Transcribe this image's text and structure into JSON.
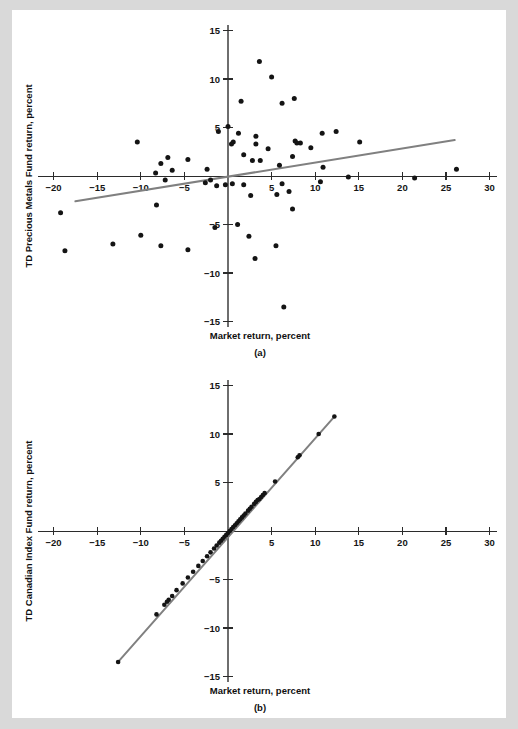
{
  "page": {
    "background_color": "#d9d9d9",
    "canvas_color": "#ffffff"
  },
  "style": {
    "point_color": "#141414",
    "fitline_color": "#808080",
    "axis_color": "#2b2b2b"
  },
  "figures": [
    {
      "id": "a",
      "panel_label": "(a)",
      "xlabel": "Market return, percent",
      "ylabel": "TD Precious Metals Fund return, percent",
      "xticks": [
        -20,
        -15,
        -10,
        -5,
        5,
        10,
        15,
        20,
        25,
        30
      ],
      "xtick_labels": [
        "−20",
        "−15",
        "−10",
        "−5",
        "5",
        "10",
        "15",
        "20",
        "25",
        "30"
      ],
      "yticks": [
        15,
        10,
        5,
        -5,
        -10,
        -15
      ],
      "ytick_labels": [
        "15",
        "10",
        "5",
        "−5",
        "−10",
        "−15"
      ]
    },
    {
      "id": "b",
      "panel_label": "(b)",
      "xlabel": "Market return, percent",
      "ylabel": "TD Canadian Index Fund return, percent",
      "xticks": [
        -20,
        -15,
        -10,
        -5,
        5,
        10,
        15,
        20,
        25,
        30
      ],
      "xtick_labels": [
        "−20",
        "−15",
        "−10",
        "−5",
        "5",
        "10",
        "15",
        "20",
        "25",
        "30"
      ],
      "yticks": [
        15,
        10,
        5,
        -5,
        -10,
        -15
      ],
      "ytick_labels": [
        "15",
        "10",
        "5",
        "−5",
        "−10",
        "−15"
      ]
    }
  ],
  "chart_data": [
    {
      "type": "scatter",
      "id": "a",
      "title": "(a)",
      "xlabel": "Market return, percent",
      "ylabel": "TD Precious Metals Fund return, percent",
      "xlim": [
        -22,
        31
      ],
      "ylim": [
        -16,
        16
      ],
      "grid": false,
      "legend": "none",
      "fit_line": {
        "x1": -17.5,
        "y1": -2.6,
        "x2": 26.0,
        "y2": 3.7
      },
      "points": [
        [
          3.6,
          11.8
        ],
        [
          5.0,
          10.2
        ],
        [
          1.5,
          7.7
        ],
        [
          6.2,
          7.5
        ],
        [
          7.6,
          8.0
        ],
        [
          0.0,
          5.1
        ],
        [
          -1.1,
          4.6
        ],
        [
          1.2,
          4.4
        ],
        [
          3.2,
          4.1
        ],
        [
          10.8,
          4.4
        ],
        [
          12.4,
          4.6
        ],
        [
          -10.4,
          3.5
        ],
        [
          0.6,
          3.5
        ],
        [
          0.4,
          3.3
        ],
        [
          3.2,
          3.3
        ],
        [
          7.7,
          3.6
        ],
        [
          7.9,
          3.4
        ],
        [
          8.3,
          3.4
        ],
        [
          15.1,
          3.5
        ],
        [
          9.5,
          2.9
        ],
        [
          4.6,
          2.8
        ],
        [
          1.8,
          2.2
        ],
        [
          -6.9,
          1.9
        ],
        [
          -4.6,
          1.7
        ],
        [
          2.8,
          1.6
        ],
        [
          3.7,
          1.6
        ],
        [
          7.4,
          2.0
        ],
        [
          -7.7,
          1.3
        ],
        [
          5.9,
          1.1
        ],
        [
          10.9,
          0.9
        ],
        [
          -6.4,
          0.6
        ],
        [
          -2.4,
          0.7
        ],
        [
          -8.3,
          0.3
        ],
        [
          -7.2,
          -0.4
        ],
        [
          -2.0,
          -0.4
        ],
        [
          -2.6,
          -0.7
        ],
        [
          -0.3,
          -0.9
        ],
        [
          0.5,
          -0.8
        ],
        [
          1.8,
          -0.9
        ],
        [
          -1.3,
          -1.0
        ],
        [
          6.2,
          -0.8
        ],
        [
          10.6,
          -0.6
        ],
        [
          13.8,
          -0.1
        ],
        [
          21.4,
          -0.2
        ],
        [
          26.2,
          0.7
        ],
        [
          7.0,
          -1.6
        ],
        [
          2.6,
          -2.0
        ],
        [
          5.6,
          -1.9
        ],
        [
          -8.2,
          -3.0
        ],
        [
          -19.2,
          -3.8
        ],
        [
          7.4,
          -3.4
        ],
        [
          1.1,
          -5.0
        ],
        [
          -1.5,
          -5.3
        ],
        [
          -10.0,
          -6.1
        ],
        [
          2.4,
          -6.2
        ],
        [
          -13.2,
          -7.0
        ],
        [
          -7.7,
          -7.2
        ],
        [
          5.5,
          -7.2
        ],
        [
          -4.6,
          -7.6
        ],
        [
          -18.7,
          -7.7
        ],
        [
          3.1,
          -8.5
        ],
        [
          6.4,
          -13.5
        ]
      ]
    },
    {
      "type": "scatter",
      "id": "b",
      "title": "(b)",
      "xlabel": "Market return, percent",
      "ylabel": "TD Canadian Index Fund return, percent",
      "xlim": [
        -22,
        31
      ],
      "ylim": [
        -16,
        16
      ],
      "grid": false,
      "legend": "none",
      "fit_line": {
        "x1": -12.6,
        "y1": -13.5,
        "x2": 12.2,
        "y2": 11.8
      },
      "points": [
        [
          12.2,
          11.8
        ],
        [
          10.4,
          10.0
        ],
        [
          8.2,
          7.8
        ],
        [
          8.0,
          7.6
        ],
        [
          5.4,
          5.1
        ],
        [
          4.2,
          3.9
        ],
        [
          4.0,
          3.7
        ],
        [
          3.8,
          3.5
        ],
        [
          3.6,
          3.3
        ],
        [
          3.4,
          3.2
        ],
        [
          3.2,
          3.0
        ],
        [
          3.0,
          2.8
        ],
        [
          2.7,
          2.5
        ],
        [
          2.5,
          2.3
        ],
        [
          2.3,
          2.1
        ],
        [
          2.0,
          1.8
        ],
        [
          1.8,
          1.6
        ],
        [
          1.6,
          1.4
        ],
        [
          1.4,
          1.2
        ],
        [
          1.2,
          1.0
        ],
        [
          1.0,
          0.8
        ],
        [
          0.8,
          0.6
        ],
        [
          0.6,
          0.4
        ],
        [
          0.4,
          0.2
        ],
        [
          0.2,
          0.0
        ],
        [
          0.0,
          -0.2
        ],
        [
          -0.2,
          -0.4
        ],
        [
          -0.4,
          -0.6
        ],
        [
          -0.6,
          -0.8
        ],
        [
          -0.8,
          -1.0
        ],
        [
          -1.0,
          -1.2
        ],
        [
          -1.3,
          -1.5
        ],
        [
          -1.6,
          -1.8
        ],
        [
          -2.0,
          -2.2
        ],
        [
          -2.4,
          -2.6
        ],
        [
          -2.9,
          -3.1
        ],
        [
          -3.4,
          -3.6
        ],
        [
          -4.0,
          -4.2
        ],
        [
          -4.6,
          -4.8
        ],
        [
          -5.2,
          -5.4
        ],
        [
          -5.9,
          -6.1
        ],
        [
          -6.4,
          -6.7
        ],
        [
          -6.8,
          -7.1
        ],
        [
          -7.0,
          -7.3
        ],
        [
          -7.3,
          -7.6
        ],
        [
          -8.2,
          -8.6
        ],
        [
          -12.6,
          -13.5
        ]
      ]
    }
  ]
}
